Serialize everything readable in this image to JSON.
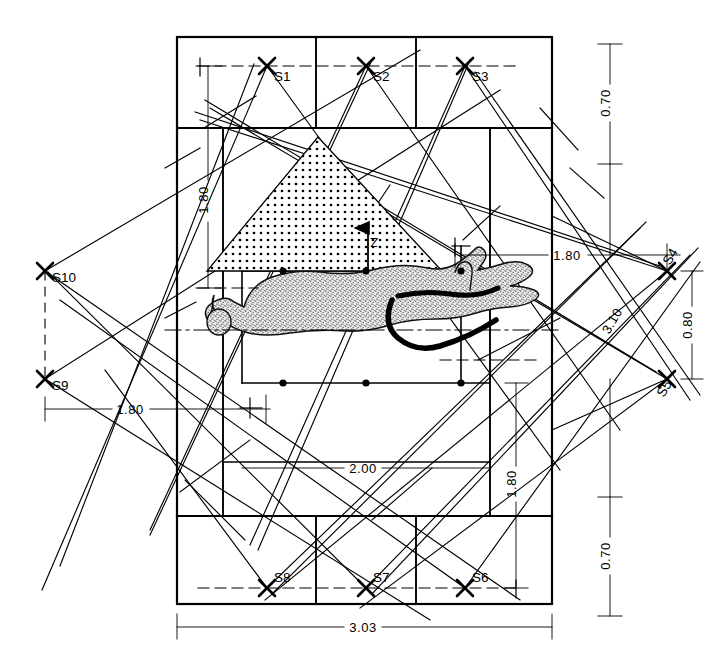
{
  "figure": {
    "type": "technical-drawing",
    "background_color": "#ffffff",
    "line_color": "#000000",
    "stipple_color": "#000000"
  },
  "stations": [
    {
      "id": "S1",
      "label": "S1",
      "x": 267,
      "y": 66,
      "text_x": 274,
      "text_y": 81
    },
    {
      "id": "S2",
      "label": "S2",
      "x": 366,
      "y": 66,
      "text_x": 373,
      "text_y": 81
    },
    {
      "id": "S3",
      "label": "S3",
      "x": 465,
      "y": 66,
      "text_x": 472,
      "text_y": 81
    },
    {
      "id": "S4",
      "label": "S4",
      "x": 667,
      "y": 271,
      "text_x": 670,
      "text_y": 266
    },
    {
      "id": "S5",
      "label": "S5",
      "x": 667,
      "y": 379,
      "text_x": 670,
      "text_y": 395
    },
    {
      "id": "S6",
      "label": "S6",
      "x": 465,
      "y": 588,
      "text_x": 472,
      "text_y": 582
    },
    {
      "id": "S7",
      "label": "S7",
      "x": 366,
      "y": 588,
      "text_x": 373,
      "text_y": 582
    },
    {
      "id": "S8",
      "label": "S8",
      "x": 267,
      "y": 588,
      "text_x": 274,
      "text_y": 582
    },
    {
      "id": "S9",
      "label": "S9",
      "x": 45,
      "y": 379,
      "text_x": 52,
      "text_y": 390
    },
    {
      "id": "S10",
      "label": "S10",
      "x": 45,
      "y": 271,
      "text_x": 52,
      "text_y": 282
    }
  ],
  "dimensions": [
    {
      "id": "dim-left-180",
      "value": "1.80",
      "orientation": "vertical",
      "x": 208,
      "y": 200
    },
    {
      "id": "dim-bottom-180",
      "value": "1.80",
      "orientation": "horizontal",
      "x": 128,
      "y": 409
    },
    {
      "id": "dim-right-180",
      "value": "1.80",
      "orientation": "horizontal",
      "x": 565,
      "y": 255
    },
    {
      "id": "dim-lower-right-180",
      "value": "1.80",
      "orientation": "vertical",
      "x": 516,
      "y": 483
    },
    {
      "id": "dim-center-200",
      "value": "2.00",
      "orientation": "horizontal",
      "x": 362,
      "y": 468
    },
    {
      "id": "dim-overall-303",
      "value": "3.03",
      "orientation": "horizontal",
      "x": 362,
      "y": 627
    },
    {
      "id": "dim-diagonal-310",
      "value": "3.10",
      "orientation": "vertical",
      "x": 616,
      "y": 323
    },
    {
      "id": "dim-right-080",
      "value": "0.80",
      "orientation": "vertical",
      "x": 692,
      "y": 325
    },
    {
      "id": "dim-right-top-070",
      "value": "0.70",
      "orientation": "vertical",
      "x": 610,
      "y": 103
    },
    {
      "id": "dim-right-bot-070",
      "value": "0.70",
      "orientation": "vertical",
      "x": 610,
      "y": 556
    }
  ],
  "annotations": [
    {
      "id": "zone-marker",
      "label": "Z",
      "x": 371,
      "y": 234
    }
  ],
  "frame": {
    "outer_left": 177,
    "outer_right": 552,
    "outer_top": 37,
    "outer_bottom": 604,
    "band_top_bottom": 128,
    "band_bottom_top": 516
  },
  "grid_columns": [
    177,
    316,
    416,
    552
  ],
  "feature": {
    "name": "stippled-triangle",
    "description": "dotted triangular zone"
  },
  "artifact": {
    "name": "engraved-animal-figure",
    "description": "stippled zoomorphic rock-art outline"
  }
}
